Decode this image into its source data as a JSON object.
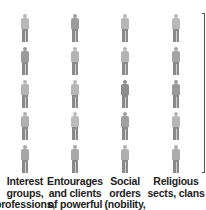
{
  "diagram": {
    "columns": [
      {
        "label": "Interest groups, professions,",
        "shades": [
          "#b8b8b8",
          "#9a9a9a",
          "#b4b4b4",
          "#b0b0b0",
          "#a6a6a6"
        ]
      },
      {
        "label": "Entourages and clients of powerful",
        "shades": [
          "#9c9c9c",
          "#b4b4b4",
          "#b6b6b6",
          "#bcbcbc",
          "#a8a8a8"
        ]
      },
      {
        "label": "Social orders (nobility,",
        "shades": [
          "#b6b6b6",
          "#b4b4b4",
          "#8e8e8e",
          "#a0a0a0",
          "#b0b0b0"
        ]
      },
      {
        "label": "Religious sects, clans",
        "shades": [
          "#b8b8b8",
          "#a6a6a6",
          "#9a9a9a",
          "#b6b6b6",
          "#acacac"
        ]
      }
    ],
    "figure_icon": "person-icon",
    "bracket_icon": "right-bracket-line"
  }
}
